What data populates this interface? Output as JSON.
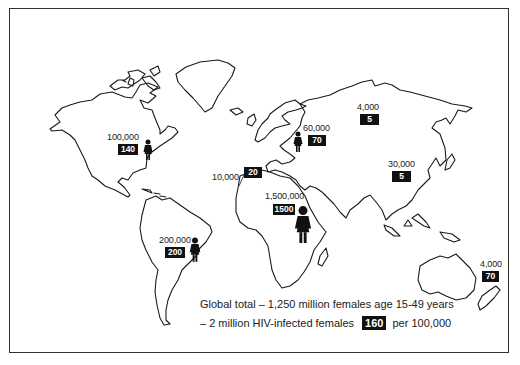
{
  "map": {
    "type": "world-outline-map",
    "subject": "HIV-infected females age 15-49 by region",
    "colors": {
      "outline": "#1a1a1a",
      "box_bg": "#111111",
      "box_text": "#ffffff",
      "background": "#ffffff"
    }
  },
  "regions": [
    {
      "name": "North America",
      "count": "100,000",
      "rate": "140",
      "icon": "female-figure-icon"
    },
    {
      "name": "Western Europe",
      "count": "60,000",
      "rate": "70",
      "icon": "female-figure-icon"
    },
    {
      "name": "Eastern Europe / Central Asia",
      "count": "4,000",
      "rate": "5",
      "icon": ""
    },
    {
      "name": "East Asia / Pacific",
      "count": "30,000",
      "rate": "5",
      "icon": ""
    },
    {
      "name": "North Africa / Middle East",
      "count": "10,000",
      "rate": "20",
      "icon": ""
    },
    {
      "name": "Sub-Saharan Africa",
      "count": "1,500,000",
      "rate": "1500",
      "icon": "female-figure-icon"
    },
    {
      "name": "Latin America",
      "count": "200,000",
      "rate": "200",
      "icon": "female-figure-icon"
    },
    {
      "name": "Australasia",
      "count": "4,000",
      "rate": "70",
      "icon": ""
    }
  ],
  "footer": {
    "line1": "Global total – 1,250 million females age 15-49 years",
    "line2_prefix": "– 2 million HIV-infected females",
    "line2_rate": "160",
    "line2_suffix": "per 100,000"
  }
}
